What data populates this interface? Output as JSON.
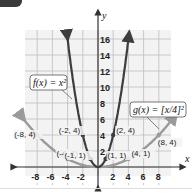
{
  "chart_data": {
    "type": "line",
    "title": "",
    "xlabel": "x",
    "ylabel": "y",
    "xlim": [
      -9,
      9
    ],
    "ylim": [
      -1,
      17
    ],
    "grid": true,
    "x_ticks": [
      -8,
      -6,
      -4,
      -2,
      2,
      4,
      6,
      8
    ],
    "y_ticks": [
      2,
      4,
      6,
      8,
      10,
      12,
      14,
      16
    ],
    "x_tick_labels": [
      "-8",
      "-6",
      "-4",
      "-2",
      "2",
      "4",
      "6",
      "8"
    ],
    "y_tick_labels": [
      "2",
      "4",
      "6",
      "8",
      "10",
      "12",
      "14",
      "16"
    ],
    "series": [
      {
        "name": "f(x) = x²",
        "label": "f(x) = x²",
        "color": "#3d3d3d",
        "points": [
          [
            -2,
            4
          ],
          [
            -1,
            1
          ],
          [
            0,
            0
          ],
          [
            1,
            1
          ],
          [
            2,
            4
          ]
        ],
        "x": [
          -4,
          -2,
          -1,
          0,
          1,
          2,
          4
        ],
        "values": [
          16,
          4,
          1,
          0,
          1,
          4,
          16
        ]
      },
      {
        "name": "g(x) = (x/4)²",
        "label": "g(x) = [x/4]²",
        "color": "#9a9a9a",
        "points": [
          [
            -8,
            4
          ],
          [
            -4,
            1
          ],
          [
            0,
            0
          ],
          [
            4,
            1
          ],
          [
            8,
            4
          ]
        ],
        "x": [
          -8,
          -4,
          0,
          4,
          8
        ],
        "values": [
          4,
          1,
          0,
          1,
          4
        ]
      }
    ],
    "annotations": [
      "(-8, 4)",
      "(-4, 1)",
      "(-2, 4)",
      "(-1, 1)",
      "(2, 4)",
      "(1, 1)",
      "(4, 1)",
      "(8, 4)"
    ]
  },
  "labels": {
    "f_label": "f(x) = x²",
    "g_label": "g(x) = [x/4]²",
    "x_axis": "x",
    "y_axis": "y"
  }
}
